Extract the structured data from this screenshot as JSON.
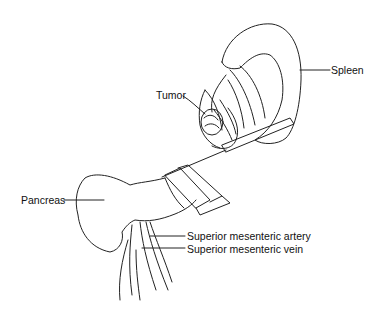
{
  "figure": {
    "labels": {
      "spleen": "Spleen",
      "tumor": "Tumor",
      "pancreas": "Pancreas",
      "sma": "Superior mesenteric artery",
      "smv": "Superior mesenteric vein"
    }
  }
}
